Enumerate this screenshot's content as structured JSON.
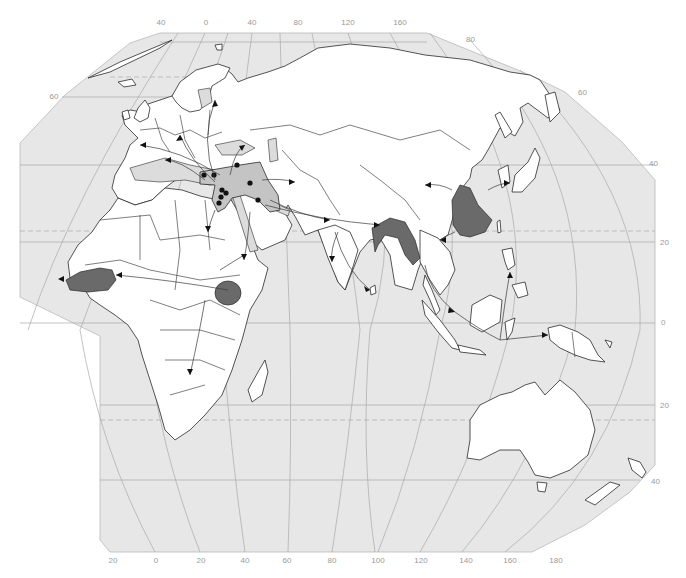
{
  "map": {
    "title": "",
    "projection": "Eckert-like world projection (Afro-Eurasia and Oceania)",
    "colors": {
      "ocean": "#e7e7e7",
      "land": "#ffffff",
      "origin_center": "#6a6a6a",
      "fertile_crescent": "#c4c4c4",
      "graticule": "#a9a9a9",
      "coastline": "#2a2a2a"
    },
    "longitude_labels_top": [
      "40",
      "0",
      "40",
      "80",
      "120",
      "160"
    ],
    "longitude_labels_bottom": [
      "20",
      "0",
      "20",
      "40",
      "60",
      "80",
      "100",
      "120",
      "140",
      "160",
      "180"
    ],
    "latitude_labels_left": [
      "60"
    ],
    "latitude_labels_right": [
      "80",
      "60",
      "40",
      "20",
      "0",
      "20",
      "40"
    ],
    "origin_regions": [
      {
        "name": "fertile-crescent",
        "shade": "medium",
        "dots": 9
      },
      {
        "name": "west-africa-sahel",
        "shade": "dark"
      },
      {
        "name": "ethiopian-highlands",
        "shade": "dark"
      },
      {
        "name": "bay-of-bengal-india-myanmar",
        "shade": "dark"
      },
      {
        "name": "eastern-china",
        "shade": "dark"
      }
    ],
    "dispersal_arrows": 24
  }
}
